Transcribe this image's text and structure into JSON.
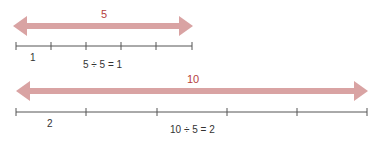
{
  "diagram": {
    "colors": {
      "arrow": "#d9a3a3",
      "line": "#555555",
      "top_label": "#b5403d",
      "text": "#333333"
    },
    "line1": {
      "arrow_label": "5",
      "segment_label": "1",
      "equation": "5 ÷ 5 = 1",
      "segments": 5
    },
    "line2": {
      "arrow_label": "10",
      "segment_label": "2",
      "equation": "10 ÷ 5 = 2",
      "segments": 5
    }
  }
}
